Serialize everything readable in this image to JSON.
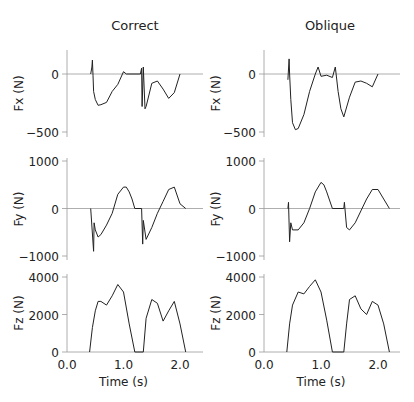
{
  "columns": [
    "Correct",
    "Oblique"
  ],
  "rows": [
    {
      "ylabel": "Fx (N)",
      "ticks": [
        "0",
        "-500"
      ]
    },
    {
      "ylabel": "Fy (N)",
      "ticks": [
        "1000",
        "0",
        "-1000"
      ]
    },
    {
      "ylabel": "Fz (N)",
      "ticks": [
        "4000",
        "2000",
        "0"
      ]
    }
  ],
  "xaxis": {
    "label": "Time (s)",
    "ticks": [
      "0.0",
      "1.0",
      "2.0"
    ]
  },
  "chart_data": {
    "type": "line",
    "xlabel": "Time (s)",
    "xlim": [
      0,
      2.4
    ],
    "panels": [
      {
        "column": "Correct",
        "ylabel": "Fx (N)",
        "ylim": [
          -550,
          220
        ],
        "series": [
          {
            "name": "Fx",
            "x": [
              0.42,
              0.44,
              0.45,
              0.46,
              0.47,
              0.5,
              0.55,
              0.6,
              0.7,
              0.8,
              0.9,
              1.0,
              1.05,
              1.3,
              1.32,
              1.33,
              1.35,
              1.38,
              1.4,
              1.5,
              1.6,
              1.7,
              1.8,
              1.9,
              2.0
            ],
            "y": [
              0,
              60,
              120,
              -10,
              -150,
              -220,
              -270,
              -265,
              -245,
              -150,
              -90,
              20,
              0,
              0,
              50,
              -280,
              60,
              -300,
              -280,
              -80,
              -60,
              -130,
              -210,
              -160,
              0
            ]
          }
        ]
      },
      {
        "column": "Oblique",
        "ylabel": "Fx (N)",
        "ylim": [
          -550,
          220
        ],
        "series": [
          {
            "name": "Fx",
            "x": [
              0.42,
              0.44,
              0.45,
              0.47,
              0.5,
              0.55,
              0.6,
              0.7,
              0.8,
              0.9,
              0.95,
              1.0,
              1.1,
              1.2,
              1.25,
              1.3,
              1.35,
              1.4,
              1.5,
              1.6,
              1.7,
              1.8,
              1.9,
              2.0
            ],
            "y": [
              -50,
              130,
              0,
              -220,
              -420,
              -480,
              -470,
              -350,
              -150,
              0,
              60,
              -20,
              -10,
              -30,
              60,
              -150,
              -300,
              -370,
              -200,
              -70,
              -60,
              -80,
              -110,
              0
            ]
          }
        ]
      },
      {
        "column": "Correct",
        "ylabel": "Fy (N)",
        "ylim": [
          -1100,
          1100
        ],
        "series": [
          {
            "name": "Fy",
            "x": [
              0.42,
              0.47,
              0.48,
              0.5,
              0.55,
              0.6,
              0.7,
              0.8,
              0.9,
              1.0,
              1.05,
              1.1,
              1.15,
              1.2,
              1.32,
              1.34,
              1.35,
              1.4,
              1.5,
              1.6,
              1.7,
              1.8,
              1.9,
              2.0,
              2.1
            ],
            "y": [
              0,
              -900,
              -300,
              -450,
              -600,
              -550,
              -350,
              -100,
              300,
              450,
              450,
              350,
              200,
              0,
              0,
              -750,
              -250,
              -650,
              -400,
              -100,
              150,
              400,
              450,
              100,
              0
            ]
          }
        ]
      },
      {
        "column": "Oblique",
        "ylabel": "Fy (N)",
        "ylim": [
          -1100,
          1100
        ],
        "series": [
          {
            "name": "Fy",
            "x": [
              0.42,
              0.43,
              0.45,
              0.47,
              0.5,
              0.6,
              0.7,
              0.8,
              0.9,
              1.0,
              1.05,
              1.1,
              1.2,
              1.4,
              1.41,
              1.45,
              1.5,
              1.6,
              1.7,
              1.8,
              1.9,
              2.0,
              2.1,
              2.2
            ],
            "y": [
              0,
              130,
              -700,
              -300,
              -450,
              -450,
              -300,
              0,
              350,
              550,
              500,
              350,
              0,
              0,
              130,
              -400,
              -450,
              -300,
              -50,
              200,
              400,
              400,
              200,
              0
            ]
          }
        ]
      },
      {
        "column": "Correct",
        "ylabel": "Fz (N)",
        "ylim": [
          0,
          4200
        ],
        "series": [
          {
            "name": "Fz",
            "x": [
              0.4,
              0.43,
              0.45,
              0.5,
              0.55,
              0.6,
              0.7,
              0.8,
              0.9,
              1.0,
              1.1,
              1.2,
              1.35,
              1.4,
              1.5,
              1.6,
              1.7,
              1.8,
              1.9,
              2.0,
              2.1
            ],
            "y": [
              0,
              800,
              1300,
              2200,
              2700,
              2700,
              2500,
              3000,
              3600,
              3200,
              1500,
              0,
              0,
              1800,
              2800,
              2600,
              1650,
              2200,
              2700,
              1500,
              0
            ]
          }
        ]
      },
      {
        "column": "Oblique",
        "ylabel": "Fz (N)",
        "ylim": [
          0,
          4200
        ],
        "series": [
          {
            "name": "Fz",
            "x": [
              0.4,
              0.45,
              0.5,
              0.6,
              0.7,
              0.8,
              0.9,
              1.0,
              1.1,
              1.2,
              1.4,
              1.45,
              1.5,
              1.6,
              1.7,
              1.8,
              1.9,
              2.0,
              2.1,
              2.2
            ],
            "y": [
              0,
              1500,
              2500,
              3200,
              3100,
              3500,
              3850,
              3200,
              1700,
              0,
              0,
              1500,
              2800,
              3000,
              2300,
              2000,
              2700,
              2500,
              1500,
              0
            ]
          }
        ]
      }
    ]
  }
}
